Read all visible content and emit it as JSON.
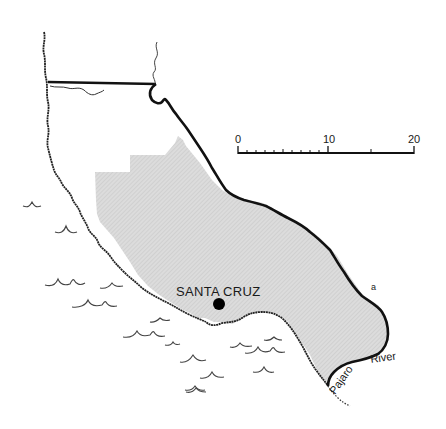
{
  "map": {
    "title": "Santa Cruz County",
    "colors": {
      "background": "#ffffff",
      "county_fill": "#d9d9d9",
      "outline": "#111111",
      "coast": "#222222",
      "city_dot": "#000000",
      "waves": "#444444"
    },
    "city": {
      "label": "SANTA CRUZ",
      "marker": "filled-circle"
    },
    "river": {
      "label_part1": "Pajaro",
      "label_part2": "River"
    },
    "feature_label": "a",
    "scale_bar": {
      "ticks": [
        "0",
        "10",
        "20"
      ],
      "units": "miles"
    }
  }
}
